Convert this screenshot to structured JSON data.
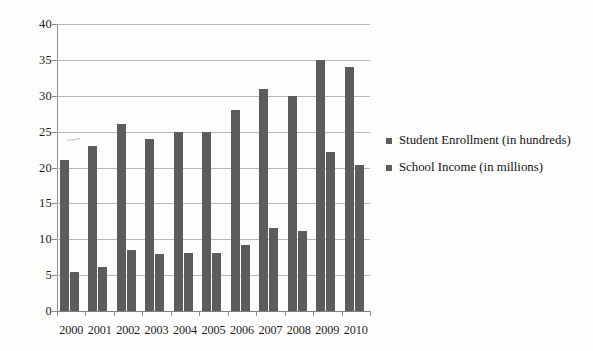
{
  "chart_data": {
    "type": "bar",
    "title": "",
    "subtitle": "",
    "xlabel": "",
    "ylabel": "",
    "categories": [
      "2000",
      "2001",
      "2002",
      "2003",
      "2004",
      "2005",
      "2006",
      "2007",
      "2008",
      "2009",
      "2010"
    ],
    "series": [
      {
        "name": "Student Enrollment (in hundreds)",
        "color": "#5c5c5c",
        "values": [
          21,
          23,
          26,
          24,
          25,
          25,
          28,
          31,
          30,
          35,
          34
        ]
      },
      {
        "name": "School Income (in millions)",
        "color": "#5c5c5c",
        "values": [
          5.5,
          6.1,
          8.5,
          8.0,
          8.1,
          8.1,
          9.2,
          11.6,
          11.1,
          22.1,
          20.3
        ]
      }
    ],
    "ylim": [
      0,
      40
    ],
    "ytick_step": 5,
    "ytick_labels": [
      "0",
      "5",
      "10",
      "15",
      "20",
      "25",
      "30",
      "35",
      "40"
    ],
    "grid": "horizontal",
    "legend_position": "right",
    "annotations": []
  },
  "axes": {
    "y_ticks": [
      {
        "label": "40",
        "value": 40
      },
      {
        "label": "35",
        "value": 35
      },
      {
        "label": "30",
        "value": 30
      },
      {
        "label": "25",
        "value": 25
      },
      {
        "label": "20",
        "value": 20
      },
      {
        "label": "15",
        "value": 15
      },
      {
        "label": "10",
        "value": 10
      },
      {
        "label": "5",
        "value": 5
      },
      {
        "label": "0",
        "value": 0
      }
    ],
    "x_ticks": [
      "2000",
      "2001",
      "2002",
      "2003",
      "2004",
      "2005",
      "2006",
      "2007",
      "2008",
      "2009",
      "2010"
    ]
  },
  "legend": {
    "entries": [
      {
        "label": "Student Enrollment (in hundreds)",
        "color": "#5c5c5c"
      },
      {
        "label": "School Income (in millions)",
        "color": "#5c5c5c"
      }
    ]
  },
  "colors": {
    "bar": "#5c5c5c",
    "gridline": "#b6b6b6",
    "axis": "#8d8d8d",
    "text": "#1d1d1d",
    "background": "#fdfdfc"
  }
}
